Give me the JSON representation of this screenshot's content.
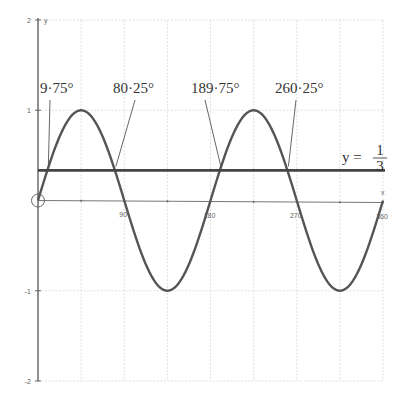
{
  "chart_data": {
    "type": "line",
    "title": "",
    "xlabel": "x",
    "ylabel": "y",
    "xlim": [
      0,
      360
    ],
    "ylim": [
      -2,
      2
    ],
    "grid": true,
    "x_ticks": [
      90,
      180,
      270,
      360
    ],
    "x_tick_labels": [
      "90",
      "180",
      "270",
      "360"
    ],
    "y_ticks": [
      2,
      1,
      -1,
      -2
    ],
    "y_tick_labels": [
      "2",
      "1",
      "-1",
      "-2"
    ],
    "series": [
      {
        "name": "y = sin 2x",
        "type": "curve",
        "function": "sin(2x)",
        "x": [
          0,
          45,
          90,
          135,
          180,
          225,
          270,
          315,
          360
        ],
        "values": [
          0,
          1,
          0,
          -1,
          0,
          1,
          0,
          -1,
          0
        ]
      },
      {
        "name": "y = 1/3",
        "type": "horizontal_line",
        "value": 0.3333
      }
    ],
    "annotations": [
      {
        "text": "9·75°",
        "x": 9.75,
        "y": 0.3333
      },
      {
        "text": "80·25°",
        "x": 80.25,
        "y": 0.3333
      },
      {
        "text": "189·75°",
        "x": 189.75,
        "y": 0.3333
      },
      {
        "text": "260·25°",
        "x": 260.25,
        "y": 0.3333
      }
    ],
    "line_label": {
      "prefix": "y =",
      "numerator": "1",
      "denominator": "3"
    },
    "origin_marker": "circle"
  }
}
